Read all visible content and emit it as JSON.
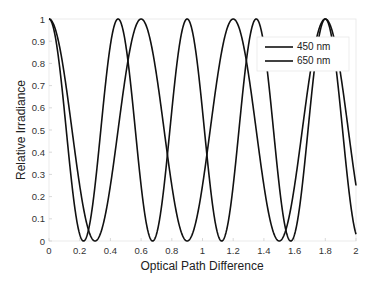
{
  "chart_data": {
    "type": "line",
    "title": "",
    "xlabel": "Optical Path Difference",
    "ylabel": "Relative Irradiance",
    "xlim": [
      0,
      2
    ],
    "ylim": [
      0,
      1
    ],
    "xticks": [
      "0",
      "0.2",
      "0.4",
      "0.6",
      "0.8",
      "1",
      "1.2",
      "1.4",
      "1.6",
      "1.8",
      "2"
    ],
    "yticks": [
      "0",
      "0.1",
      "0.2",
      "0.3",
      "0.4",
      "0.5",
      "0.6",
      "0.7",
      "0.8",
      "0.9",
      "1"
    ],
    "grid": false,
    "legend_position": "upper right",
    "series": [
      {
        "name": "450 nm",
        "formula": "cos^2(pi * x / 0.45)",
        "period": 0.45,
        "peaks_x": [
          0,
          0.45,
          0.9,
          1.35,
          1.8
        ],
        "minima_x": [
          0.225,
          0.675,
          1.125,
          1.575
        ],
        "color": "#111111"
      },
      {
        "name": "650 nm",
        "formula": "cos^2(pi * x / 0.6)",
        "period": 0.6,
        "peaks_x": [
          0,
          0.6,
          1.2,
          1.8
        ],
        "minima_x": [
          0.3,
          0.9,
          1.5
        ],
        "color": "#111111"
      }
    ]
  },
  "legend": {
    "items": [
      {
        "label": "450 nm"
      },
      {
        "label": "650 nm"
      }
    ]
  }
}
